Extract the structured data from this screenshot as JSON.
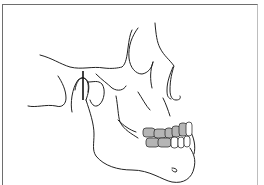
{
  "figure": {
    "subject": "Lateral view of skull and mandible line drawing",
    "highlight": "shaded posterior teeth (molars/premolars) in occlusion",
    "marker": "vertical line at temporomandibular joint condyle",
    "colors": {
      "line": "#222222",
      "tooth_shaded": "#b5b5b5",
      "frame": "#6e6e6e",
      "background": "#ffffff"
    }
  }
}
